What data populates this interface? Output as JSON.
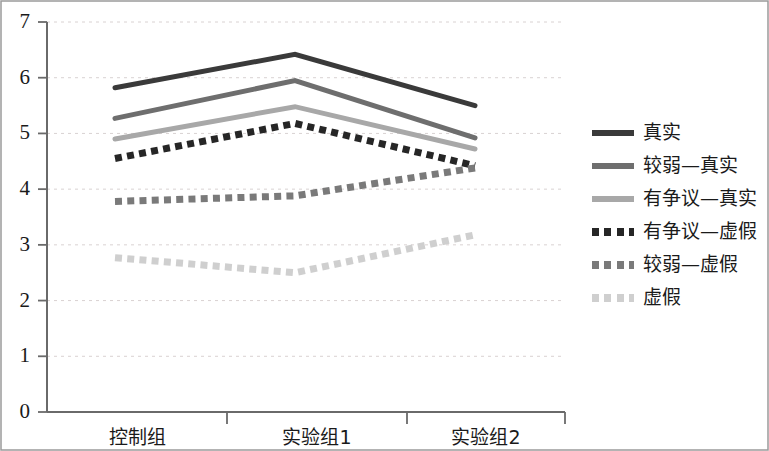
{
  "chart_data": {
    "type": "line",
    "title": "",
    "xlabel": "",
    "ylabel": "",
    "categories": [
      "控制组",
      "实验组1",
      "实验组2"
    ],
    "ylim": [
      0,
      7
    ],
    "yticks": [
      0,
      1,
      2,
      3,
      4,
      5,
      6,
      7
    ],
    "ytick_labels": [
      "0",
      "1",
      "2",
      "3",
      "4",
      "5",
      "6",
      "7"
    ],
    "grid": true,
    "grid_style": "dotted-horizontal",
    "legend_position": "right",
    "series": [
      {
        "name": "真实",
        "values": [
          5.82,
          6.42,
          5.5
        ],
        "color": "#3a3a3a",
        "style": "solid",
        "width": 5
      },
      {
        "name": "较弱—真实",
        "values": [
          5.27,
          5.95,
          4.92
        ],
        "color": "#6e6e6e",
        "style": "solid",
        "width": 5
      },
      {
        "name": "有争议—真实",
        "values": [
          4.9,
          5.48,
          4.72
        ],
        "color": "#a8a8a8",
        "style": "solid",
        "width": 5
      },
      {
        "name": "有争议—虚假",
        "values": [
          4.55,
          5.18,
          4.42
        ],
        "color": "#262626",
        "style": "dotted",
        "width": 7
      },
      {
        "name": "较弱—虚假",
        "values": [
          3.78,
          3.88,
          4.38
        ],
        "color": "#7a7a7a",
        "style": "dotted",
        "width": 7
      },
      {
        "name": "虚假",
        "values": [
          2.77,
          2.5,
          3.18
        ],
        "color": "#cfcfcf",
        "style": "dotted",
        "width": 7
      }
    ]
  },
  "axis": {
    "y_axis_name": "y-axis",
    "x_axis_name": "x-axis"
  },
  "frame": {
    "border_color": "#8a8a8a"
  }
}
